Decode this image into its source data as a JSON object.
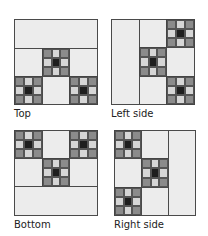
{
  "panels": [
    {
      "id": "top",
      "label": "Top"
    },
    {
      "id": "left",
      "label": "Left side"
    },
    {
      "id": "bottom",
      "label": "Bottom"
    },
    {
      "id": "right",
      "label": "Right side"
    }
  ],
  "colors": {
    "plain_square": "#ececec",
    "ninepatch_corner": "#8b8b8b",
    "ninepatch_edge": "#d6d6d6",
    "ninepatch_center": "#1e1e1e",
    "outline": "#3a3a3a"
  }
}
